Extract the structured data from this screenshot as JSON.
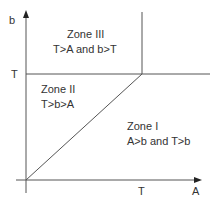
{
  "axes": {
    "x_label": "A",
    "y_label": "b",
    "x_tick_label": "T",
    "y_tick_label": "T"
  },
  "zones": [
    {
      "name": "Zone III",
      "condition": "T>A and b>T"
    },
    {
      "name": "Zone II",
      "condition": "T>b>A"
    },
    {
      "name": "Zone I",
      "condition": "A>b and T>b"
    }
  ],
  "colors": {
    "line": "#555555",
    "text": "#333333",
    "background": "#ffffff"
  }
}
